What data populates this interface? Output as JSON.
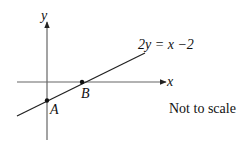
{
  "diagram": {
    "type": "coordinate-line-graph",
    "axes": {
      "x_label": "x",
      "y_label": "y"
    },
    "line": {
      "equation": "2y = x −2",
      "label": "2y = x −2"
    },
    "points": [
      {
        "name": "A",
        "label": "A",
        "description": "y-intercept"
      },
      {
        "name": "B",
        "label": "B",
        "description": "x-intercept"
      }
    ],
    "note": "Not to scale",
    "colors": {
      "stroke": "#222222",
      "background": "#ffffff"
    }
  }
}
